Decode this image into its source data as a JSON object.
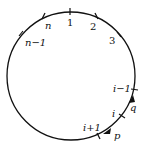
{
  "diagram": {
    "type": "circle-with-labeled-points",
    "points": [
      {
        "label": "1",
        "italic": false
      },
      {
        "label": "2",
        "italic": false
      },
      {
        "label": "3",
        "italic": false
      },
      {
        "label": "n",
        "italic": true
      },
      {
        "label": "n−1",
        "italic": true
      },
      {
        "label": "i−1",
        "italic": true
      },
      {
        "label": "i",
        "italic": true
      },
      {
        "label": "i+1",
        "italic": true
      }
    ],
    "arrows": [
      {
        "label": "q"
      },
      {
        "label": "p"
      }
    ],
    "caption": ""
  }
}
